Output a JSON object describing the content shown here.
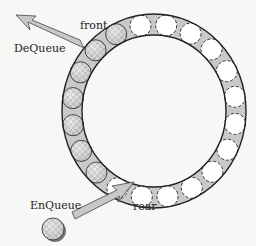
{
  "diagram": {
    "labels": {
      "front": "front",
      "rear": "rear",
      "dequeue": "DeQueue",
      "enqueue": "EnQueue"
    },
    "ring": {
      "center": [
        154,
        111
      ],
      "outer_radii": [
        92,
        97
      ],
      "inner_radii": [
        72,
        76
      ],
      "fill_color": "#c8c8c8",
      "stroke_color": "#222222"
    },
    "slots": {
      "total": 20,
      "filled_count": 7,
      "empty_count": 13,
      "filled_style": "checkered",
      "empty_style": "dashed-outline",
      "slot_radius": 10.5
    },
    "arrows": [
      {
        "name": "dequeue-arrow",
        "from": [
          80,
          46
        ],
        "to": [
          18,
          16
        ],
        "color": "#c8c8c8"
      },
      {
        "name": "enqueue-arrow",
        "from": [
          72,
          216
        ],
        "to": [
          132,
          182
        ],
        "color": "#c8c8c8"
      }
    ],
    "incoming_element": {
      "center": [
        53,
        229
      ],
      "style": "checkered"
    }
  }
}
